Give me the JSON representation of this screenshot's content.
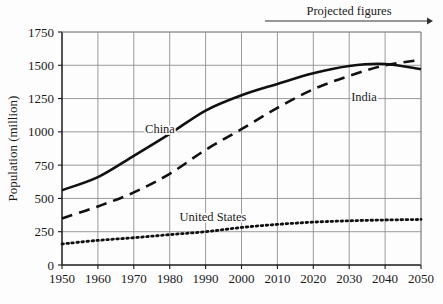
{
  "chart_data": {
    "type": "line",
    "title": "",
    "xlabel": "",
    "ylabel": "Population (million)",
    "xlim": [
      1950,
      2050
    ],
    "ylim": [
      0,
      1750
    ],
    "grid": true,
    "legend_position": "inline-labels",
    "xticks": [
      "1950",
      "1960",
      "1970",
      "1980",
      "1990",
      "2000",
      "2010",
      "2020",
      "2030",
      "2040",
      "2050"
    ],
    "yticks": [
      "0",
      "250",
      "500",
      "750",
      "1000",
      "1250",
      "1500",
      "1750"
    ],
    "x": [
      1950,
      1960,
      1970,
      1980,
      1990,
      2000,
      2010,
      2020,
      2030,
      2040,
      2050
    ],
    "annotations": [
      {
        "text": "Projected figures",
        "x_start": 2005,
        "x_end": 2050,
        "kind": "arrow-right"
      }
    ],
    "series": [
      {
        "name": "China",
        "label": "China",
        "style": "solid",
        "color": "#111111",
        "values": [
          562,
          660,
          820,
          985,
          1160,
          1275,
          1360,
          1440,
          1495,
          1510,
          1470
        ]
      },
      {
        "name": "India",
        "label": "India",
        "style": "dashed",
        "color": "#111111",
        "values": [
          350,
          440,
          545,
          685,
          865,
          1020,
          1180,
          1320,
          1420,
          1500,
          1540
        ]
      },
      {
        "name": "United States",
        "label": "United States",
        "style": "dotted",
        "color": "#111111",
        "values": [
          158,
          185,
          205,
          228,
          250,
          282,
          305,
          322,
          332,
          338,
          342
        ]
      }
    ]
  }
}
